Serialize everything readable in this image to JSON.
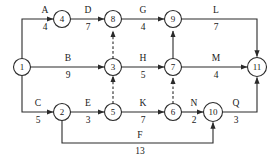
{
  "diagram": {
    "type": "activity-network",
    "stroke_color": "#2a2a2a",
    "background_color": "#ffffff",
    "nodes": [
      {
        "id": "1",
        "label": "1",
        "x": 22,
        "y": 67,
        "r": 8.5
      },
      {
        "id": "4",
        "label": "4",
        "x": 62,
        "y": 19,
        "r": 8.5
      },
      {
        "id": "8",
        "label": "8",
        "x": 113,
        "y": 19,
        "r": 8.5
      },
      {
        "id": "9",
        "label": "9",
        "x": 173,
        "y": 19,
        "r": 8.5
      },
      {
        "id": "3",
        "label": "3",
        "x": 113,
        "y": 67,
        "r": 8.5
      },
      {
        "id": "7",
        "label": "7",
        "x": 173,
        "y": 67,
        "r": 8.5
      },
      {
        "id": "11",
        "label": "11",
        "x": 257,
        "y": 67,
        "r": 9.5
      },
      {
        "id": "2",
        "label": "2",
        "x": 62,
        "y": 112,
        "r": 8.5
      },
      {
        "id": "5",
        "label": "5",
        "x": 113,
        "y": 112,
        "r": 8.5
      },
      {
        "id": "6",
        "label": "6",
        "x": 173,
        "y": 112,
        "r": 8.5
      },
      {
        "id": "10",
        "label": "10",
        "x": 213,
        "y": 112,
        "r": 9.5
      }
    ],
    "edges": [
      {
        "name": "A",
        "duration": "4",
        "from": "1",
        "to": "4",
        "dashed": false,
        "label_x": 45,
        "name_y": 13,
        "dur_y": 28
      },
      {
        "name": "D",
        "duration": "7",
        "from": "4",
        "to": "8",
        "dashed": false,
        "label_x": 88,
        "name_y": 13,
        "dur_y": 28
      },
      {
        "name": "G",
        "duration": "4",
        "from": "8",
        "to": "9",
        "dashed": false,
        "label_x": 143,
        "name_y": 13,
        "dur_y": 28
      },
      {
        "name": "L",
        "duration": "7",
        "from": "9",
        "to": "11",
        "dashed": false,
        "label_x": 215,
        "name_y": 13,
        "dur_y": 28
      },
      {
        "name": "B",
        "duration": "9",
        "from": "1",
        "to": "3",
        "dashed": false,
        "label_x": 68,
        "name_y": 61,
        "dur_y": 76
      },
      {
        "name": "H",
        "duration": "5",
        "from": "3",
        "to": "7",
        "dashed": false,
        "label_x": 143,
        "name_y": 61,
        "dur_y": 76
      },
      {
        "name": "M",
        "duration": "4",
        "from": "7",
        "to": "11",
        "dashed": false,
        "label_x": 215,
        "name_y": 61,
        "dur_y": 76
      },
      {
        "name": "C",
        "duration": "5",
        "from": "1",
        "to": "2",
        "dashed": false,
        "label_x": 38,
        "name_y": 106,
        "dur_y": 121
      },
      {
        "name": "E",
        "duration": "3",
        "from": "2",
        "to": "5",
        "dashed": false,
        "label_x": 88,
        "name_y": 106,
        "dur_y": 121
      },
      {
        "name": "K",
        "duration": "7",
        "from": "5",
        "to": "6",
        "dashed": false,
        "label_x": 143,
        "name_y": 106,
        "dur_y": 121
      },
      {
        "name": "N",
        "duration": "2",
        "from": "6",
        "to": "10",
        "dashed": false,
        "label_x": 194,
        "name_y": 106,
        "dur_y": 121
      },
      {
        "name": "Q",
        "duration": "3",
        "from": "10",
        "to": "11",
        "dashed": false,
        "label_x": 234,
        "name_y": 106,
        "dur_y": 121
      },
      {
        "name": "F",
        "duration": "13",
        "from": "2",
        "to": "10",
        "dashed": false,
        "label_x": 140,
        "name_y": 135,
        "dur_y": 150
      },
      {
        "name": "",
        "duration": "",
        "from": "5",
        "to": "8",
        "dashed": true,
        "label_x": 0,
        "name_y": 0,
        "dur_y": 0
      },
      {
        "name": "",
        "duration": "",
        "from": "6",
        "to": "7",
        "dashed": true,
        "label_x": 0,
        "name_y": 0,
        "dur_y": 0
      }
    ],
    "dummy_edges_note": "dashed arrows are dummy activities"
  }
}
